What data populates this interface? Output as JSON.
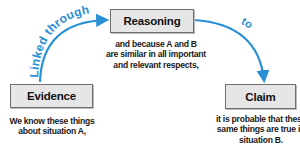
{
  "colors": {
    "arrow": "#2a8fd6",
    "box_fill": "#e6e6e6",
    "box_border": "#6e6e6e",
    "text": "#1a1a1a"
  },
  "nodes": {
    "reasoning": {
      "label": "Reasoning",
      "lines": [
        "and because A and B",
        "are similar in all important",
        "and relevant respects,"
      ]
    },
    "evidence": {
      "label": "Evidence",
      "lines": [
        "We know these things",
        "about situation A,"
      ]
    },
    "claim": {
      "label": "Claim",
      "lines": [
        "it is probable that these",
        "same things are true in",
        "situation B."
      ]
    }
  },
  "edges": [
    {
      "from": "Evidence",
      "to": "Reasoning",
      "label": "Linked through"
    },
    {
      "from": "Reasoning",
      "to": "Claim",
      "label": "to"
    }
  ]
}
